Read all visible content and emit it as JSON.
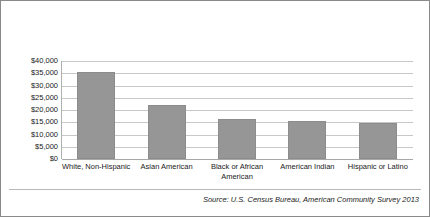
{
  "chart_data": {
    "type": "bar",
    "title": "",
    "subtitle": "",
    "xlabel": "",
    "ylabel": "",
    "categories": [
      "White, Non-Hispanic",
      "Asian American",
      "Black or African American",
      "American Indian",
      "Hispanic or Latino"
    ],
    "values": [
      35500,
      22000,
      16500,
      15500,
      14800
    ],
    "ylim": [
      0,
      40000
    ],
    "ytick_values": [
      0,
      5000,
      10000,
      15000,
      20000,
      25000,
      30000,
      35000,
      40000
    ],
    "ytick_labels": [
      "$0",
      "$5,000",
      "$10,000",
      "$15,000",
      "$20,000",
      "$25,000",
      "$30,000",
      "$35,000",
      "$40,000"
    ],
    "grid": true,
    "legend": false,
    "legend_position": "none",
    "series": [
      {
        "name": "Median Income",
        "values": [
          35500,
          22000,
          16500,
          15500,
          14800
        ]
      }
    ],
    "bar_color": "#969696",
    "bar_edge_color": "#8c8c8c",
    "gridline_color": "#c8c8c8",
    "axis_color": "#a8a8a8",
    "text_color": "#1a1a1a"
  },
  "footer": {
    "source_note": "Source: U.S. Census Bureau, American Community Survey 2013"
  }
}
